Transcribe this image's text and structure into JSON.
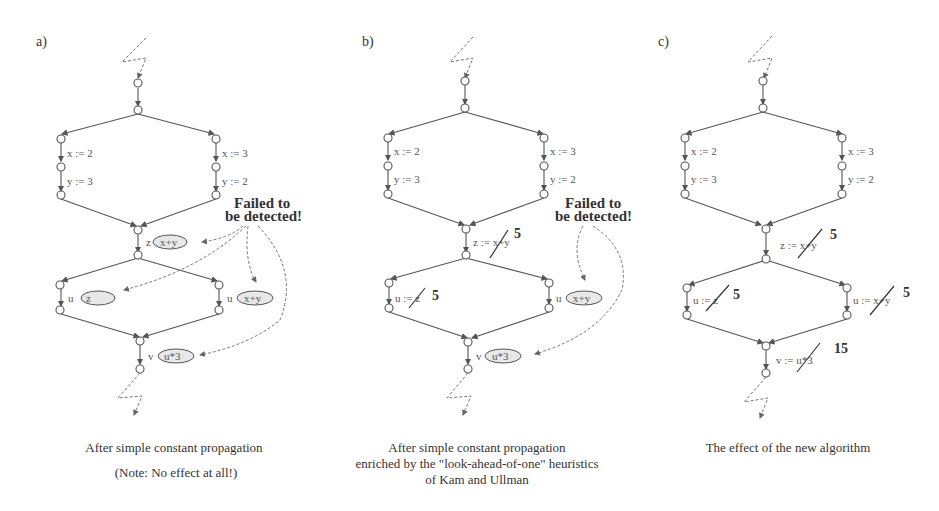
{
  "figure": {
    "panels": [
      {
        "id": "a",
        "label": "a)",
        "left_branch": [
          "x := 2",
          "y := 3"
        ],
        "right_branch": [
          "x := 3",
          "y := 2"
        ],
        "z_stmt": {
          "lhs": "z",
          "rhs": "x+y"
        },
        "u_left": {
          "lhs": "u",
          "rhs": "z"
        },
        "u_right": {
          "lhs": "u",
          "rhs": "x+y"
        },
        "v_stmt": {
          "lhs": "v",
          "rhs": "u*3"
        },
        "annotation": [
          "Failed to",
          "be detected!"
        ],
        "caption": [
          "After simple constant propagation",
          "(Note: No effect at all!)"
        ]
      },
      {
        "id": "b",
        "label": "b)",
        "left_branch": [
          "x := 2",
          "y := 3"
        ],
        "right_branch": [
          "x := 3",
          "y := 2"
        ],
        "z_stmt": {
          "text": "z := x+y",
          "value": "5"
        },
        "u_left": {
          "text": "u := z",
          "value": "5"
        },
        "u_right": {
          "lhs": "u",
          "rhs": "x+y"
        },
        "v_stmt": {
          "lhs": "v",
          "rhs": "u*3"
        },
        "annotation": [
          "Failed to",
          "be detected!"
        ],
        "caption": [
          "After simple constant propagation",
          "enriched by the \"look-ahead-of-one\" heuristics",
          "of Kam and Ullman"
        ]
      },
      {
        "id": "c",
        "label": "c)",
        "left_branch": [
          "x := 2",
          "y := 3"
        ],
        "right_branch": [
          "x := 3",
          "y := 2"
        ],
        "z_stmt": {
          "text": "z := x+y",
          "value": "5"
        },
        "u_left": {
          "text": "u := z",
          "value": "5"
        },
        "u_right": {
          "text": "u := x+y",
          "value": "5"
        },
        "v_stmt": {
          "text": "v := u*3",
          "value": "15"
        },
        "caption": [
          "The effect of the new algorithm"
        ]
      }
    ]
  }
}
